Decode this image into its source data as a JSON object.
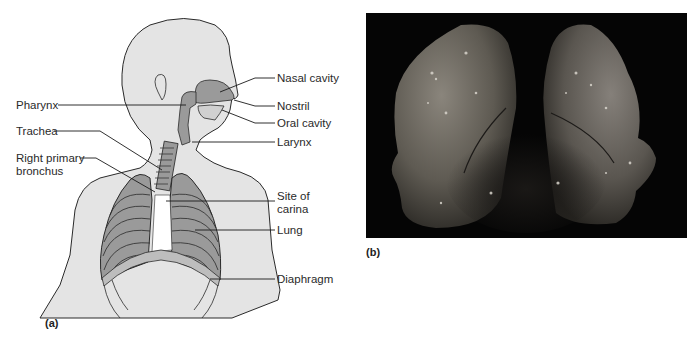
{
  "figure": {
    "panel_a": {
      "tag": "(a)",
      "title": "Human respiratory system diagram",
      "labels_left": [
        {
          "id": "pharynx",
          "text": "Pharynx"
        },
        {
          "id": "trachea",
          "text": "Trachea"
        },
        {
          "id": "right-primary-bronchus",
          "line1": "Right primary",
          "line2": "bronchus"
        }
      ],
      "labels_right": [
        {
          "id": "nasal-cavity",
          "text": "Nasal cavity"
        },
        {
          "id": "nostril",
          "text": "Nostril"
        },
        {
          "id": "oral-cavity",
          "text": "Oral cavity"
        },
        {
          "id": "larynx",
          "text": "Larynx"
        },
        {
          "id": "site-of-carina",
          "line1": "Site of",
          "line2": "carina"
        },
        {
          "id": "lung",
          "text": "Lung"
        },
        {
          "id": "diaphragm",
          "text": "Diaphragm"
        }
      ]
    },
    "panel_b": {
      "tag": "(b)",
      "title": "Photograph of excised human lungs on black background"
    },
    "colors": {
      "body_fill": "#e4e4e4",
      "organ_fill": "#9a9a9a",
      "outline": "#2a2a2a",
      "photo_bg": "#050505",
      "tissue": "#6e6a62"
    }
  }
}
